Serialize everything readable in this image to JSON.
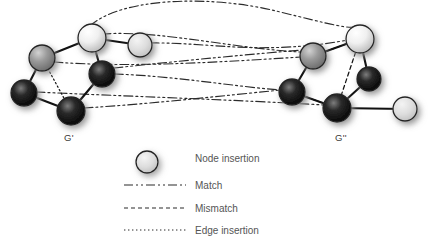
{
  "figure": {
    "background_color": "#ffffff",
    "graph_labels": [
      {
        "id": "left-graph-label",
        "text": "G'",
        "x": 69,
        "y": 141
      },
      {
        "id": "right-graph-label",
        "text": "G''",
        "x": 341,
        "y": 141
      }
    ]
  },
  "legend": {
    "items": [
      {
        "key": "node-insertion",
        "label": "Node insertion",
        "style": "node",
        "text_x": 195,
        "y": 162
      },
      {
        "key": "match",
        "label": "Match",
        "style": "dashdotdot",
        "text_x": 195,
        "y": 189
      },
      {
        "key": "mismatch",
        "label": "Mismatch",
        "style": "dashed",
        "text_x": 195,
        "y": 212
      },
      {
        "key": "edge-insertion",
        "label": "Edge insertion",
        "style": "dotted",
        "text_x": 195,
        "y": 234
      }
    ],
    "sample_x_start": 124,
    "sample_x_end": 186,
    "node_sample": {
      "cx": 147,
      "cy": 162,
      "r": 11
    }
  },
  "colors": {
    "edge": "#111111",
    "correspondence": "#2b2b2b",
    "text": "#555555",
    "label": "#3a3a3a",
    "node_dark": "#1b1b1b",
    "node_mid": "#8a8a8a",
    "node_light": "#f2f2f2",
    "node_insert": "#dcdcdc",
    "node_outline": "#242424",
    "shadow": "#9a9a9a"
  },
  "graphs": {
    "left": {
      "name": "G'",
      "nodes": [
        {
          "id": "L1",
          "cx": 42,
          "cy": 58,
          "r": 13,
          "shade": "mid",
          "kind": "original"
        },
        {
          "id": "L2",
          "cx": 92,
          "cy": 38,
          "r": 14,
          "shade": "light",
          "kind": "original"
        },
        {
          "id": "L3",
          "cx": 140,
          "cy": 45,
          "r": 12,
          "shade": "insert",
          "kind": "insertion"
        },
        {
          "id": "L4",
          "cx": 102,
          "cy": 74,
          "r": 13,
          "shade": "dark",
          "kind": "original"
        },
        {
          "id": "L5",
          "cx": 24,
          "cy": 93,
          "r": 13,
          "shade": "dark",
          "kind": "original"
        },
        {
          "id": "L6",
          "cx": 71,
          "cy": 111,
          "r": 14,
          "shade": "dark",
          "kind": "original"
        }
      ],
      "edges": [
        {
          "from": "L1",
          "to": "L2",
          "style": "solid"
        },
        {
          "from": "L2",
          "to": "L3",
          "style": "solid"
        },
        {
          "from": "L2",
          "to": "L4",
          "style": "solid"
        },
        {
          "from": "L1",
          "to": "L5",
          "style": "solid"
        },
        {
          "from": "L5",
          "to": "L6",
          "style": "solid"
        },
        {
          "from": "L6",
          "to": "L4",
          "style": "solid"
        },
        {
          "from": "L1",
          "to": "L6",
          "style": "dotted"
        }
      ]
    },
    "right": {
      "name": "G''",
      "nodes": [
        {
          "id": "R1",
          "cx": 360,
          "cy": 39,
          "r": 14,
          "shade": "light",
          "kind": "original"
        },
        {
          "id": "R2",
          "cx": 313,
          "cy": 56,
          "r": 13,
          "shade": "mid",
          "kind": "original"
        },
        {
          "id": "R3",
          "cx": 292,
          "cy": 92,
          "r": 13,
          "shade": "dark",
          "kind": "original"
        },
        {
          "id": "R4",
          "cx": 337,
          "cy": 108,
          "r": 14,
          "shade": "dark",
          "kind": "original"
        },
        {
          "id": "R5",
          "cx": 369,
          "cy": 79,
          "r": 12,
          "shade": "dark",
          "kind": "original"
        },
        {
          "id": "R6",
          "cx": 405,
          "cy": 109,
          "r": 12,
          "shade": "insert",
          "kind": "insertion"
        }
      ],
      "edges": [
        {
          "from": "R2",
          "to": "R1",
          "style": "solid"
        },
        {
          "from": "R1",
          "to": "R5",
          "style": "solid"
        },
        {
          "from": "R5",
          "to": "R4",
          "style": "solid"
        },
        {
          "from": "R4",
          "to": "R3",
          "style": "solid"
        },
        {
          "from": "R3",
          "to": "R2",
          "style": "solid"
        },
        {
          "from": "R4",
          "to": "R6",
          "style": "solid"
        },
        {
          "from": "R2",
          "to": "R1",
          "style": "dashed-inner"
        },
        {
          "from": "R1",
          "to": "R4",
          "style": "dashed"
        },
        {
          "from": "R3",
          "to": "R4",
          "style": "dashed"
        }
      ]
    }
  },
  "correspondences": [
    {
      "id": "c1",
      "from": "L2",
      "to": "R1",
      "style": "dashdotdot",
      "path": "M 90 26 C 120 -2 210 -6 280 12 C 330 24 350 30 358 26"
    },
    {
      "id": "c2",
      "from": "L2",
      "to": "R2",
      "style": "dashdotdot",
      "path": "M 102 34 C 160 30 230 48 300 52"
    },
    {
      "id": "c3",
      "from": "L3",
      "to": "R1",
      "style": "dashdotdot",
      "path": "M 150 43 C 210 42 260 56 348 40"
    },
    {
      "id": "c4",
      "from": "L4",
      "to": "R2",
      "style": "dashdotdot",
      "path": "M 114 68 C 170 62 230 56 302 50"
    },
    {
      "id": "c5",
      "from": "L4",
      "to": "R3",
      "style": "dashdotdot",
      "path": "M 114 74 C 175 76 230 86 280 90"
    },
    {
      "id": "c6",
      "from": "L6",
      "to": "R3",
      "style": "dashdotdot",
      "path": "M 84 108 C 150 104 220 96 281 90"
    },
    {
      "id": "c7",
      "from": "L1",
      "to": "R2",
      "style": "dashdotdot",
      "path": "M 54 62 C 130 68 220 62 301 57"
    },
    {
      "id": "c8",
      "from": "L5",
      "to": "R4",
      "style": "dashdotdot",
      "path": "M 36 92 C 120 96 240 100 324 105"
    }
  ]
}
